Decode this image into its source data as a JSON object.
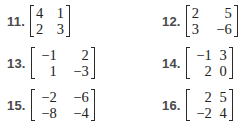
{
  "problems": [
    {
      "number": "11.",
      "matrix": [
        [
          "4",
          "1"
        ],
        [
          "2",
          "3"
        ]
      ]
    },
    {
      "number": "12.",
      "matrix": [
        [
          "2",
          "5"
        ],
        [
          "3",
          "−6"
        ]
      ]
    },
    {
      "number": "13.",
      "matrix": [
        [
          "−1",
          "2"
        ],
        [
          "1",
          "−3"
        ]
      ]
    },
    {
      "number": "14.",
      "matrix": [
        [
          "−1",
          "3"
        ],
        [
          "2",
          "0"
        ]
      ]
    },
    {
      "number": "15.",
      "matrix": [
        [
          "−2",
          "−6"
        ],
        [
          "−8",
          "−4"
        ]
      ]
    },
    {
      "number": "16.",
      "matrix": [
        [
          "2",
          "5"
        ],
        [
          "−2",
          "4"
        ]
      ]
    }
  ]
}
